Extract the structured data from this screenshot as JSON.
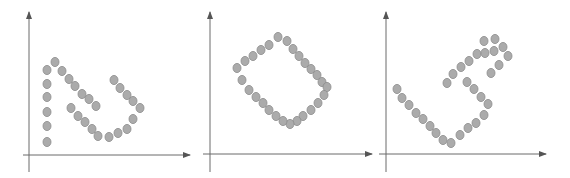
{
  "figure": {
    "width": 570,
    "height": 178,
    "background": "#ffffff",
    "point_fill": "#ababab",
    "point_stroke": "#8c8c8c",
    "point_rx": 4,
    "point_ry": 4.6,
    "axis_color": "#6a6a6a"
  },
  "panels": [
    {
      "name": "panel-1",
      "shape": "N-shaped point cluster",
      "y_axis": {
        "x": 29,
        "y_top": 12,
        "y_bottom": 172
      },
      "x_axis": {
        "y": 155,
        "x_left": 23,
        "x_right": 190
      },
      "points": [
        [
          47,
          70
        ],
        [
          47,
          84
        ],
        [
          47,
          97
        ],
        [
          47,
          112
        ],
        [
          47,
          126
        ],
        [
          47,
          142
        ],
        [
          55,
          62
        ],
        [
          62,
          71
        ],
        [
          69,
          79
        ],
        [
          75,
          86
        ],
        [
          82,
          94
        ],
        [
          89,
          99
        ],
        [
          96,
          106
        ],
        [
          71,
          108
        ],
        [
          78,
          116
        ],
        [
          85,
          122
        ],
        [
          92,
          129
        ],
        [
          98,
          136
        ],
        [
          109,
          137
        ],
        [
          118,
          133
        ],
        [
          127,
          129
        ],
        [
          133,
          119
        ],
        [
          114,
          80
        ],
        [
          120,
          88
        ],
        [
          127,
          95
        ],
        [
          133,
          101
        ],
        [
          140,
          108
        ]
      ]
    },
    {
      "name": "panel-2",
      "shape": "rotated rectangle of points",
      "y_axis": {
        "x": 210,
        "y_top": 12,
        "y_bottom": 172
      },
      "x_axis": {
        "y": 154,
        "x_left": 203,
        "x_right": 372
      },
      "points": [
        [
          237,
          68
        ],
        [
          245,
          61
        ],
        [
          253,
          56
        ],
        [
          261,
          50
        ],
        [
          269,
          45
        ],
        [
          278,
          37
        ],
        [
          287,
          41
        ],
        [
          293,
          49
        ],
        [
          299,
          56
        ],
        [
          305,
          63
        ],
        [
          311,
          69
        ],
        [
          317,
          75
        ],
        [
          322,
          82
        ],
        [
          327,
          87
        ],
        [
          324,
          95
        ],
        [
          318,
          103
        ],
        [
          311,
          110
        ],
        [
          303,
          116
        ],
        [
          297,
          121
        ],
        [
          290,
          124
        ],
        [
          283,
          121
        ],
        [
          276,
          116
        ],
        [
          269,
          110
        ],
        [
          263,
          103
        ],
        [
          256,
          97
        ],
        [
          249,
          90
        ],
        [
          242,
          80
        ]
      ]
    },
    {
      "name": "panel-3",
      "shape": "V-shape with S-curve point cluster",
      "y_axis": {
        "x": 386,
        "y_top": 12,
        "y_bottom": 172
      },
      "x_axis": {
        "y": 154,
        "x_left": 379,
        "x_right": 546
      },
      "points": [
        [
          397,
          89
        ],
        [
          402,
          98
        ],
        [
          409,
          105
        ],
        [
          416,
          113
        ],
        [
          423,
          119
        ],
        [
          430,
          126
        ],
        [
          436,
          133
        ],
        [
          443,
          140
        ],
        [
          451,
          143
        ],
        [
          460,
          135
        ],
        [
          468,
          128
        ],
        [
          476,
          123
        ],
        [
          484,
          115
        ],
        [
          488,
          104
        ],
        [
          481,
          97
        ],
        [
          474,
          89
        ],
        [
          467,
          82
        ],
        [
          447,
          83
        ],
        [
          453,
          74
        ],
        [
          461,
          67
        ],
        [
          469,
          61
        ],
        [
          477,
          54
        ],
        [
          485,
          53
        ],
        [
          494,
          51
        ],
        [
          484,
          41
        ],
        [
          495,
          39
        ],
        [
          503,
          47
        ],
        [
          508,
          56
        ],
        [
          499,
          65
        ],
        [
          491,
          73
        ]
      ]
    }
  ]
}
